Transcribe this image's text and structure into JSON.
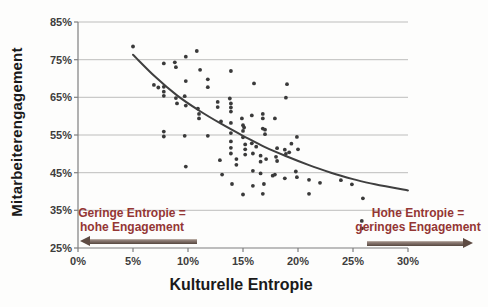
{
  "chart_data": {
    "type": "scatter",
    "title": "",
    "xlabel": "Kulturelle Entropie",
    "ylabel": "Mitarbeiterengagement",
    "xlim": [
      0,
      30
    ],
    "ylim": [
      25,
      85
    ],
    "x_tick_values": [
      0,
      5,
      10,
      15,
      20,
      25,
      30
    ],
    "x_tick_labels": [
      "0%",
      "5%",
      "10%",
      "15%",
      "20%",
      "25%",
      "30%"
    ],
    "y_tick_values": [
      25,
      35,
      45,
      55,
      65,
      75,
      85
    ],
    "y_tick_labels": [
      "25%",
      "35%",
      "45%",
      "55%",
      "65%",
      "75%",
      "85%"
    ],
    "grid": true,
    "legend": "none",
    "points": [
      [
        5.0,
        78.5
      ],
      [
        7.8,
        74.0
      ],
      [
        8.8,
        74.3
      ],
      [
        8.9,
        73.0
      ],
      [
        9.8,
        75.8
      ],
      [
        10.8,
        77.3
      ],
      [
        11.1,
        72.3
      ],
      [
        13.9,
        72.0
      ],
      [
        9.8,
        69.3
      ],
      [
        6.9,
        68.3
      ],
      [
        7.3,
        67.6
      ],
      [
        7.8,
        67.8
      ],
      [
        7.8,
        66.5
      ],
      [
        7.8,
        65.4
      ],
      [
        11.8,
        69.8
      ],
      [
        11.8,
        67.7
      ],
      [
        16.0,
        68.7
      ],
      [
        19.0,
        68.5
      ],
      [
        8.9,
        64.8
      ],
      [
        9.0,
        63.4
      ],
      [
        9.7,
        65.3
      ],
      [
        9.8,
        62.8
      ],
      [
        10.9,
        62.0
      ],
      [
        11.0,
        60.6
      ],
      [
        11.0,
        59.4
      ],
      [
        12.7,
        63.8
      ],
      [
        12.7,
        62.4
      ],
      [
        13.8,
        64.7
      ],
      [
        13.9,
        63.4
      ],
      [
        13.9,
        62.3
      ],
      [
        13.9,
        61.2
      ],
      [
        13.0,
        58.6
      ],
      [
        13.9,
        58.2
      ],
      [
        14.9,
        59.4
      ],
      [
        15.0,
        57.6
      ],
      [
        15.8,
        60.2
      ],
      [
        16.8,
        60.6
      ],
      [
        16.8,
        59.4
      ],
      [
        16.8,
        56.7
      ],
      [
        17.9,
        59.4
      ],
      [
        18.9,
        64.9
      ],
      [
        15.1,
        57.0
      ],
      [
        7.8,
        55.9
      ],
      [
        7.8,
        54.6
      ],
      [
        9.7,
        54.8
      ],
      [
        11.8,
        54.8
      ],
      [
        13.9,
        55.5
      ],
      [
        13.9,
        53.3
      ],
      [
        13.9,
        51.6
      ],
      [
        13.9,
        50.1
      ],
      [
        15.0,
        56.1
      ],
      [
        15.0,
        54.4
      ],
      [
        15.2,
        52.5
      ],
      [
        15.2,
        51.2
      ],
      [
        15.2,
        49.8
      ],
      [
        16.2,
        51.9
      ],
      [
        16.6,
        49.5
      ],
      [
        14.4,
        48.6
      ],
      [
        14.4,
        47.1
      ],
      [
        17.0,
        56.4
      ],
      [
        17.0,
        55.2
      ],
      [
        15.8,
        52.8
      ],
      [
        15.9,
        50.1
      ],
      [
        12.9,
        48.3
      ],
      [
        16.6,
        47.9
      ],
      [
        17.1,
        48.6
      ],
      [
        18.1,
        51.5
      ],
      [
        19.2,
        50.4
      ],
      [
        20.0,
        51.2
      ],
      [
        18.0,
        49.2
      ],
      [
        18.1,
        48.1
      ],
      [
        18.8,
        51.1
      ],
      [
        18.9,
        50.0
      ],
      [
        19.4,
        52.7
      ],
      [
        19.9,
        54.5
      ],
      [
        9.8,
        46.6
      ],
      [
        13.1,
        44.5
      ],
      [
        14.0,
        42.0
      ],
      [
        15.9,
        45.5
      ],
      [
        16.6,
        44.8
      ],
      [
        15.9,
        41.5
      ],
      [
        16.9,
        42.0
      ],
      [
        15.0,
        39.2
      ],
      [
        16.8,
        39.4
      ],
      [
        17.7,
        44.2
      ],
      [
        17.9,
        44.5
      ],
      [
        18.8,
        43.5
      ],
      [
        19.8,
        45.3
      ],
      [
        19.9,
        43.8
      ],
      [
        21.0,
        43.1
      ],
      [
        22.0,
        42.3
      ],
      [
        21.0,
        39.4
      ],
      [
        23.9,
        43.0
      ],
      [
        24.9,
        41.9
      ],
      [
        25.9,
        38.2
      ],
      [
        25.8,
        32.2
      ],
      [
        25.8,
        30.2
      ]
    ],
    "trend_line": {
      "shape": "exponential-decay",
      "samples": [
        [
          5,
          76.3
        ],
        [
          7,
          70.5
        ],
        [
          9,
          65.5
        ],
        [
          11,
          61.5
        ],
        [
          13,
          58.0
        ],
        [
          15,
          54.8
        ],
        [
          17,
          51.8
        ],
        [
          19,
          49.3
        ],
        [
          21,
          47.0
        ],
        [
          23,
          45.0
        ],
        [
          25,
          43.3
        ],
        [
          27,
          41.9
        ],
        [
          30,
          40.3
        ]
      ]
    },
    "annotations": [
      {
        "id": "low-entropy",
        "lines": [
          "Geringe Entropie =",
          "hohe Engagement"
        ],
        "arrow_direction": "left"
      },
      {
        "id": "high-entropy",
        "lines": [
          "Hohe Entropie =",
          "geringes Engagement"
        ],
        "arrow_direction": "right"
      }
    ],
    "colors": {
      "point": "#3a3a3a",
      "trend": "#3f3f3f",
      "grid": "#b5b5b5",
      "axis": "#7f7f7f",
      "tick_label": "#3d3d3d",
      "axis_title": "#1a1a1a",
      "annotation_text": "#943634",
      "arrow": "#5e4b43"
    }
  }
}
